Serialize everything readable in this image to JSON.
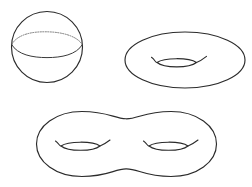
{
  "figure": {
    "background_color": "#ffffff",
    "stroke_color": "#2b2b2b",
    "hidden_line_color": "#6b6b6b",
    "width": 252,
    "height": 187,
    "shapes": [
      {
        "name": "sphere",
        "label": "sphere",
        "genus": "0",
        "holes": 0,
        "description": "Circle with elliptical equator: solid front arc and dotted back arc",
        "center_x": 47,
        "center_y": 47,
        "radius_x": 36,
        "radius_y": 36,
        "equator_center_y": 45,
        "equator_radius_y": 11,
        "equator_front_style": "solid",
        "equator_back_style": "dotted"
      },
      {
        "name": "torus",
        "label": "torus",
        "genus": "1",
        "holes": 1,
        "description": "Ellipse outline with one lens-shaped hole and an arc above it",
        "center_x": 185,
        "center_y": 60,
        "radius_x": 60,
        "radius_y": 28,
        "hole_center_x": 176,
        "hole_center_y": 63,
        "hole_half_width": 21,
        "hole_half_height": 5
      },
      {
        "name": "double-torus",
        "label": "double torus",
        "genus": "2",
        "holes": 2,
        "description": "Peanut (figure-eight) outline with two lens-shaped holes",
        "center_x": 126,
        "center_y": 144,
        "left_lobe_x": 82,
        "right_lobe_x": 171,
        "lobe_radius_x": 46,
        "lobe_radius_y": 33,
        "hole_left_center_x": 80,
        "hole_left_center_y": 146,
        "hole_right_center_x": 168,
        "hole_right_center_y": 146,
        "hole_half_width": 21,
        "hole_half_height": 5
      }
    ]
  }
}
